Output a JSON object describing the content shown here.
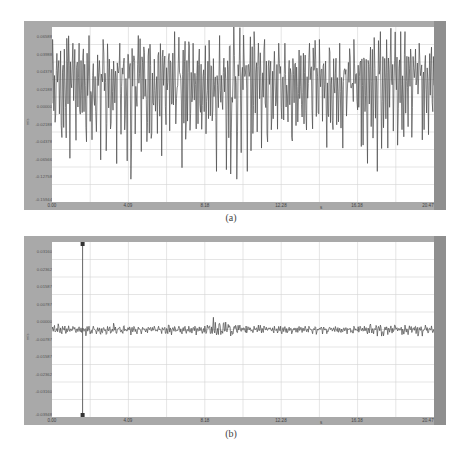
{
  "chart_data": [
    {
      "type": "line",
      "caption": "(a)",
      "title": "",
      "xlabel": "",
      "ylabel": "m/s",
      "xlim": [
        0.0,
        20.47
      ],
      "ylim": [
        -0.1594,
        0.0659
      ],
      "x_ticks": [
        "0.00",
        "4.09",
        "8.18",
        "12.28",
        "16.38",
        "20.47"
      ],
      "y_ticks": [
        "0.06588",
        "0.03988",
        "0.04378",
        "0.02188",
        "0.00000",
        "-0.02188",
        "-0.04378",
        "-0.06566",
        "-0.12758",
        "-0.15944"
      ],
      "grid": true,
      "description": "Dense oscillating vibration signal with large amplitude, roughly symmetric about zero",
      "series": [
        {
          "name": "signal-a",
          "x": [
            0.0,
            0.5,
            1.0,
            1.5,
            2.0,
            2.5,
            3.0,
            3.5,
            4.0,
            4.5,
            5.0,
            5.5,
            6.0,
            6.5,
            7.0,
            7.5,
            8.0,
            8.5,
            9.0,
            9.5,
            10.0,
            10.5,
            11.0,
            11.5,
            12.0,
            12.5,
            13.0,
            13.5,
            14.0,
            14.5,
            15.0,
            15.5,
            16.0,
            16.5,
            17.0,
            17.5,
            18.0,
            18.5,
            19.0,
            19.5,
            20.0
          ],
          "envelope_max": [
            0.05,
            0.06,
            0.045,
            0.055,
            0.04,
            0.05,
            0.055,
            0.045,
            0.05,
            0.055,
            0.06,
            0.05,
            0.045,
            0.06,
            0.05,
            0.045,
            0.05,
            0.055,
            0.06,
            0.07,
            0.065,
            0.06,
            0.05,
            0.04,
            0.045,
            0.04,
            0.04,
            0.045,
            0.05,
            0.04,
            0.045,
            0.04,
            0.05,
            0.05,
            0.055,
            0.06,
            0.065,
            0.06,
            0.05,
            0.045,
            0.04
          ],
          "envelope_min": [
            -0.09,
            -0.12,
            -0.08,
            -0.1,
            -0.1,
            -0.12,
            -0.11,
            -0.09,
            -0.13,
            -0.1,
            -0.11,
            -0.1,
            -0.09,
            -0.12,
            -0.1,
            -0.09,
            -0.11,
            -0.12,
            -0.13,
            -0.13,
            -0.12,
            -0.1,
            -0.09,
            -0.09,
            -0.08,
            -0.09,
            -0.08,
            -0.09,
            -0.1,
            -0.09,
            -0.08,
            -0.09,
            -0.1,
            -0.11,
            -0.12,
            -0.14,
            -0.12,
            -0.11,
            -0.1,
            -0.09,
            -0.08
          ]
        }
      ]
    },
    {
      "type": "line",
      "caption": "(b)",
      "title": "",
      "xlabel": "",
      "ylabel": "m/s",
      "xlim": [
        0.0,
        20.47
      ],
      "ylim": [
        -0.0395,
        0.0395
      ],
      "x_ticks": [
        "0.00",
        "4.09",
        "8.18",
        "12.28",
        "16.38",
        "20.47"
      ],
      "y_ticks": [
        "0.03160",
        "0.02362",
        "0.01587",
        "0.00787",
        "0.00000",
        "-0.00787",
        "-0.01587",
        "-0.02362",
        "-0.03160",
        "-0.03948"
      ],
      "grid": true,
      "cursor_x": 1.64,
      "description": "Low-amplitude residual vibration signal close to zero, with slightly larger burst near x≈8.5–9",
      "series": [
        {
          "name": "signal-b",
          "x": [
            0.0,
            0.5,
            1.0,
            1.5,
            2.0,
            2.5,
            3.0,
            3.5,
            4.0,
            4.5,
            5.0,
            5.5,
            6.0,
            6.5,
            7.0,
            7.5,
            8.0,
            8.5,
            9.0,
            9.5,
            10.0,
            10.5,
            11.0,
            11.5,
            12.0,
            12.5,
            13.0,
            13.5,
            14.0,
            14.5,
            15.0,
            15.5,
            16.0,
            16.5,
            17.0,
            17.5,
            18.0,
            18.5,
            19.0,
            19.5,
            20.0
          ],
          "envelope_max": [
            0.003,
            0.002,
            0.0015,
            0.0015,
            0.0015,
            0.002,
            0.003,
            0.002,
            0.0015,
            0.0015,
            0.0015,
            0.0015,
            0.002,
            0.0015,
            0.0015,
            0.002,
            0.003,
            0.0055,
            0.004,
            0.0025,
            0.002,
            0.0015,
            0.002,
            0.0015,
            0.0015,
            0.0012,
            0.0015,
            0.0015,
            0.0015,
            0.0012,
            0.0015,
            0.0012,
            0.0015,
            0.0015,
            0.0025,
            0.002,
            0.002,
            0.002,
            0.002,
            0.0025,
            0.002
          ],
          "envelope_min": [
            -0.002,
            -0.003,
            -0.003,
            -0.003,
            -0.002,
            -0.0025,
            -0.003,
            -0.0025,
            -0.0025,
            -0.002,
            -0.002,
            -0.002,
            -0.0025,
            -0.002,
            -0.002,
            -0.0025,
            -0.003,
            -0.004,
            -0.0035,
            -0.003,
            -0.0025,
            -0.002,
            -0.002,
            -0.0025,
            -0.002,
            -0.002,
            -0.002,
            -0.002,
            -0.0025,
            -0.002,
            -0.002,
            -0.002,
            -0.002,
            -0.002,
            -0.003,
            -0.003,
            -0.0025,
            -0.0025,
            -0.0025,
            -0.003,
            -0.0025
          ]
        }
      ]
    }
  ],
  "panels": {
    "a": {
      "caption": "(a)",
      "ylabel": "m/s",
      "y_ticks": [
        "0.06588",
        "0.03988",
        "0.04378",
        "0.02188",
        "0.00000",
        "-0.02188",
        "-0.04378",
        "-0.06566",
        "-0.12758",
        "-0.15944"
      ],
      "x_ticks": [
        "0.00",
        "4.09",
        "8.18",
        "12.28",
        "16.38",
        "20.47"
      ],
      "x_axis_marker": "s"
    },
    "b": {
      "caption": "(b)",
      "ylabel": "m/s",
      "y_ticks": [
        "0.03160",
        "0.02362",
        "0.01587",
        "0.00787",
        "0.00000",
        "-0.00787",
        "-0.01587",
        "-0.02362",
        "-0.03160",
        "-0.03948"
      ],
      "x_ticks": [
        "0.00",
        "4.09",
        "8.18",
        "12.28",
        "16.38",
        "20.47"
      ],
      "x_axis_marker": "s"
    }
  },
  "colors": {
    "frame": "#a9a9a9",
    "frame_right": "#8f8f8f",
    "plot_bg": "#ffffff",
    "grid": "#d4d4d4",
    "signal": "#4a4a4a",
    "cursor": "#555555"
  }
}
